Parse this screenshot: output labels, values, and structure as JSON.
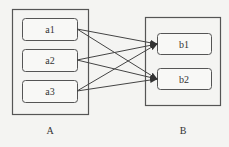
{
  "diagram": {
    "groups": [
      {
        "id": "A",
        "label": "A",
        "nodes": [
          "a1",
          "a2",
          "a3"
        ]
      },
      {
        "id": "B",
        "label": "B",
        "nodes": [
          "b1",
          "b2"
        ]
      }
    ],
    "nodes": {
      "a1": "a1",
      "a2": "a2",
      "a3": "a3",
      "b1": "b1",
      "b2": "b2"
    },
    "edges": [
      {
        "from": "a1",
        "to": "b1"
      },
      {
        "from": "a1",
        "to": "b2"
      },
      {
        "from": "a2",
        "to": "b1"
      },
      {
        "from": "a2",
        "to": "b2"
      },
      {
        "from": "a3",
        "to": "b1"
      },
      {
        "from": "a3",
        "to": "b2"
      }
    ],
    "colors": {
      "stroke": "#555555",
      "background": "#f4f4f2"
    }
  }
}
